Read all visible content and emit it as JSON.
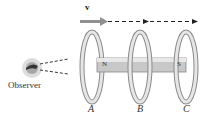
{
  "diagram": {
    "velocity_label": "v",
    "observer_label": "Observer",
    "magnet": {
      "north_label": "N",
      "south_label": "S"
    },
    "rings": [
      {
        "label": "A"
      },
      {
        "label": "B"
      },
      {
        "label": "C"
      }
    ],
    "colors": {
      "ring": "#d9d9d9",
      "ring_stroke": "#888888",
      "magnet": "#cfcfcf",
      "velocity_arrow": "#808080",
      "dashed_line": "#222222"
    }
  }
}
